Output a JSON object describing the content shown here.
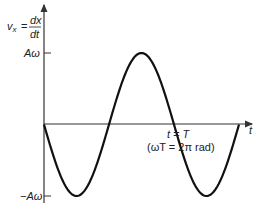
{
  "chart_data": {
    "type": "line",
    "title": "",
    "ylabel_lhs": "v",
    "ylabel_sub": "x",
    "ylabel_num": "dx",
    "ylabel_den": "dt",
    "xlabel": "t",
    "yticks": [
      "Aω",
      "−Aω"
    ],
    "annotation_line1": "t = T",
    "annotation_line2": "(ωT = 2π rad)",
    "function": "v_x = -Aω sin(ωt)",
    "x": [
      0,
      0.25,
      0.5,
      0.75,
      1.0,
      1.25,
      1.5
    ],
    "x_unit": "T",
    "values": [
      0,
      -1,
      0,
      1,
      0,
      -1,
      0
    ],
    "y_unit": "Aω",
    "ylim": [
      -1,
      1
    ],
    "colors": {
      "curve": "#111111",
      "axes": "#333333"
    }
  }
}
